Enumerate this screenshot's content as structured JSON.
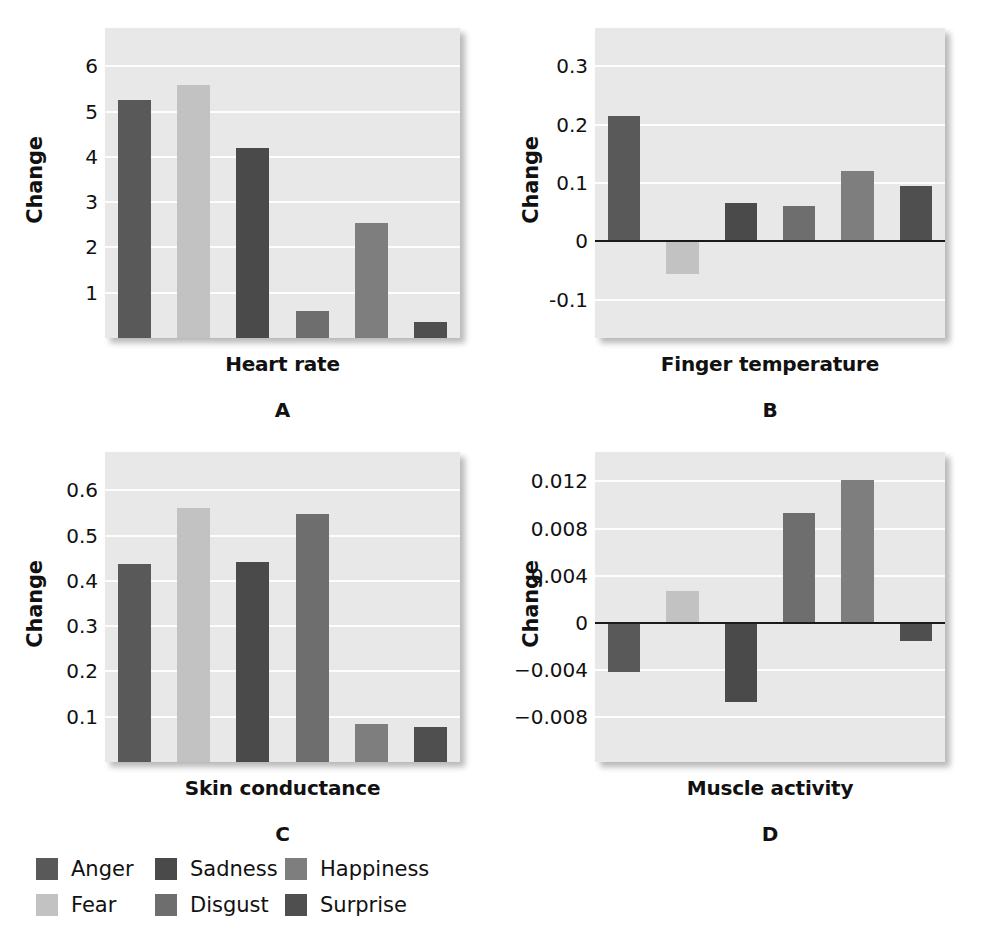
{
  "figure": {
    "title": "",
    "panels": [
      {
        "id": "A",
        "caption": "(A)",
        "xlabel": "Heart rate",
        "ylabel": "Change"
      },
      {
        "id": "B",
        "caption": "(B)",
        "xlabel": "Finger temperature",
        "ylabel": "Change"
      },
      {
        "id": "C",
        "caption": "(C)",
        "xlabel": "Skin conductance",
        "ylabel": "Change"
      },
      {
        "id": "D",
        "caption": "(D)",
        "xlabel": "Muscle activity",
        "ylabel": "Change"
      }
    ]
  },
  "legend": {
    "items": [
      {
        "label": "Anger",
        "color": "#595959"
      },
      {
        "label": "Sadness",
        "color": "#4a4a4a"
      },
      {
        "label": "Happiness",
        "color": "#7e7e7e"
      },
      {
        "label": "Fear",
        "color": "#c2c2c2"
      },
      {
        "label": "Disgust",
        "color": "#6e6e6e"
      },
      {
        "label": "Surprise",
        "color": "#4f4f4f"
      }
    ]
  },
  "colors": {
    "plot_background": "#e8e8e8",
    "gridline": "#fdfdfd",
    "axis_text": "#111111",
    "zero_line": "#1a1a1a"
  },
  "chart_data": [
    {
      "type": "bar",
      "id": "A",
      "title": "",
      "xlabel": "Heart rate",
      "ylabel": "Change",
      "categories": [
        "Anger",
        "Fear",
        "Sadness",
        "Disgust",
        "Happiness",
        "Surprise"
      ],
      "values": [
        5.25,
        5.6,
        4.2,
        0.6,
        2.55,
        0.35
      ],
      "colors": [
        "#595959",
        "#c2c2c2",
        "#4a4a4a",
        "#6e6e6e",
        "#7e7e7e",
        "#4f4f4f"
      ],
      "yticks": [
        1,
        2,
        3,
        4,
        5,
        6
      ],
      "yticklabels": [
        "1",
        "2",
        "3",
        "4",
        "5",
        "6"
      ],
      "ylim": [
        0,
        6.85
      ],
      "grid": true,
      "zero_line": false,
      "legend_position": "below-figure"
    },
    {
      "type": "bar",
      "id": "B",
      "title": "",
      "xlabel": "Finger temperature",
      "ylabel": "Change",
      "categories": [
        "Anger",
        "Fear",
        "Sadness",
        "Disgust",
        "Happiness",
        "Surprise"
      ],
      "values": [
        0.215,
        -0.055,
        0.065,
        0.06,
        0.12,
        0.095
      ],
      "colors": [
        "#595959",
        "#c2c2c2",
        "#4a4a4a",
        "#6e6e6e",
        "#7e7e7e",
        "#4f4f4f"
      ],
      "yticks": [
        0.3,
        0.2,
        0.1,
        0,
        -0.1
      ],
      "yticklabels": [
        "0.3",
        "0.2",
        "0.1",
        "0",
        "-0.1"
      ],
      "ylim": [
        -0.165,
        0.365
      ],
      "grid": true,
      "zero_line": true,
      "legend_position": "below-figure"
    },
    {
      "type": "bar",
      "id": "C",
      "title": "",
      "xlabel": "Skin conductance",
      "ylabel": "Change",
      "categories": [
        "Anger",
        "Fear",
        "Sadness",
        "Disgust",
        "Happiness",
        "Surprise"
      ],
      "values": [
        0.437,
        0.562,
        0.443,
        0.548,
        0.085,
        0.077
      ],
      "colors": [
        "#595959",
        "#c2c2c2",
        "#4a4a4a",
        "#6e6e6e",
        "#7e7e7e",
        "#4f4f4f"
      ],
      "yticks": [
        0.1,
        0.2,
        0.3,
        0.4,
        0.5,
        0.6
      ],
      "yticklabels": [
        "0.1",
        "0.2",
        "0.3",
        "0.4",
        "0.5",
        "0.6"
      ],
      "ylim": [
        0,
        0.685
      ],
      "grid": true,
      "zero_line": false,
      "legend_position": "below-figure"
    },
    {
      "type": "bar",
      "id": "D",
      "title": "",
      "xlabel": "Muscle activity",
      "ylabel": "Change",
      "categories": [
        "Anger",
        "Fear",
        "Sadness",
        "Disgust",
        "Happiness",
        "Surprise"
      ],
      "values": [
        -0.0042,
        0.0027,
        -0.0067,
        0.0093,
        0.0121,
        -0.0015
      ],
      "colors": [
        "#595959",
        "#c2c2c2",
        "#4a4a4a",
        "#6e6e6e",
        "#7e7e7e",
        "#4f4f4f"
      ],
      "yticks": [
        0.012,
        0.008,
        0.004,
        0,
        -0.004,
        -0.008
      ],
      "yticklabels": [
        "0.012",
        "0.008",
        "0.004",
        "0",
        "−0.004",
        "−0.008"
      ],
      "ylim": [
        -0.0118,
        0.0145
      ],
      "grid": true,
      "zero_line": true,
      "legend_position": "below-figure"
    }
  ]
}
